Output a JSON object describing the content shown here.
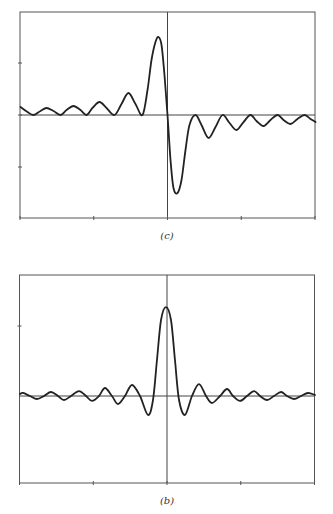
{
  "chart_data": [
    {
      "id": "c",
      "type": "line",
      "title": "",
      "caption": "(c)",
      "xlabel": "",
      "ylabel": "",
      "grid": false,
      "legend": null,
      "xlim": [
        -2,
        2
      ],
      "ylim": [
        -2,
        2
      ],
      "xticks": [
        -2,
        -1,
        0,
        1,
        2
      ],
      "yticks": [
        -1,
        0,
        1
      ],
      "tick_labels_shown": false,
      "series": [
        {
          "name": "curve-c",
          "x": [
            -1.993,
            -1.898,
            -1.817,
            -1.722,
            -1.641,
            -1.546,
            -1.451,
            -1.369,
            -1.275,
            -1.18,
            -1.098,
            -1.017,
            -0.922,
            -0.827,
            -0.719,
            -0.624,
            -0.529,
            -0.434,
            -0.339,
            -0.271,
            -0.217,
            -0.163,
            -0.122,
            -0.081,
            -0.041,
            0.0,
            0.041,
            0.081,
            0.136,
            0.19,
            0.244,
            0.298,
            0.38,
            0.461,
            0.556,
            0.651,
            0.746,
            0.841,
            0.936,
            1.031,
            1.125,
            1.207,
            1.302,
            1.397,
            1.492,
            1.573,
            1.668,
            1.763,
            1.858,
            1.939,
            2.007
          ],
          "y": [
            0.154,
            0.058,
            0.0,
            0.077,
            0.135,
            0.077,
            0.0,
            0.096,
            0.173,
            0.096,
            0.0,
            0.135,
            0.25,
            0.135,
            0.0,
            0.212,
            0.423,
            0.212,
            0.0,
            0.481,
            1.058,
            1.404,
            1.5,
            1.346,
            0.769,
            0.0,
            -0.865,
            -1.404,
            -1.5,
            -1.25,
            -0.673,
            -0.192,
            0.0,
            -0.192,
            -0.442,
            -0.231,
            0.0,
            -0.154,
            -0.288,
            -0.135,
            0.0,
            -0.115,
            -0.212,
            -0.096,
            0.0,
            -0.096,
            -0.173,
            -0.077,
            0.0,
            -0.077,
            -0.135
          ]
        }
      ]
    },
    {
      "id": "b",
      "type": "line",
      "title": "",
      "caption": "(b)",
      "xlabel": "",
      "ylabel": "",
      "grid": false,
      "legend": null,
      "xlim": [
        -2,
        2
      ],
      "ylim": [
        -1.25,
        1.25
      ],
      "xticks": [
        -2,
        -1,
        0,
        1,
        2
      ],
      "yticks": [
        1
      ],
      "tick_labels_shown": false,
      "series": [
        {
          "name": "curve-b",
          "x": [
            -1.993,
            -1.953,
            -1.858,
            -1.763,
            -1.668,
            -1.573,
            -1.478,
            -1.397,
            -1.302,
            -1.193,
            -1.098,
            -1.017,
            -0.922,
            -0.841,
            -0.746,
            -0.665,
            -0.57,
            -0.475,
            -0.366,
            -0.258,
            -0.19,
            -0.136,
            -0.081,
            -0.014,
            0.054,
            0.108,
            0.163,
            0.244,
            0.339,
            0.434,
            0.529,
            0.61,
            0.719,
            0.814,
            0.895,
            0.99,
            1.085,
            1.18,
            1.261,
            1.356,
            1.451,
            1.546,
            1.627,
            1.722,
            1.817,
            1.912,
            2.007
          ],
          "y": [
            0.029,
            0.043,
            0.0,
            -0.043,
            0.0,
            0.057,
            0.0,
            -0.057,
            0.0,
            0.071,
            0.0,
            -0.071,
            0.0,
            0.114,
            0.0,
            -0.114,
            0.0,
            0.157,
            0.0,
            -0.271,
            -0.057,
            0.514,
            1.086,
            1.271,
            1.086,
            0.514,
            -0.057,
            -0.271,
            0.0,
            0.171,
            0.0,
            -0.1,
            0.0,
            0.1,
            0.0,
            -0.071,
            0.0,
            0.071,
            0.0,
            -0.057,
            0.0,
            0.057,
            0.0,
            -0.043,
            0.0,
            0.043,
            0.014
          ]
        }
      ]
    }
  ],
  "figures": {
    "c": {
      "caption": "(c)"
    },
    "b": {
      "caption": "(b)"
    }
  }
}
